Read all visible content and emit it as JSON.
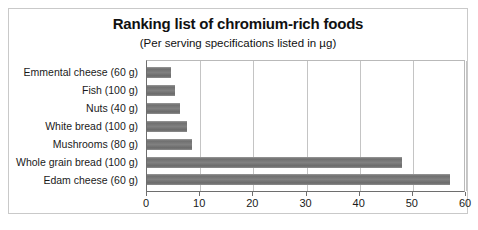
{
  "chart_data": {
    "type": "bar",
    "orientation": "horizontal",
    "title": "Ranking list of chromium-rich foods",
    "subtitle": "(Per serving specifications listed in µg)",
    "xlabel": "",
    "ylabel": "",
    "xlim": [
      0,
      60
    ],
    "xticks": [
      0,
      10,
      20,
      30,
      40,
      50,
      60
    ],
    "grid": true,
    "grid_axis": "x",
    "legend": false,
    "categories": [
      "Emmental cheese (60 g)",
      "Fish (100 g)",
      "Nuts (40 g)",
      "White bread (100 g)",
      "Mushrooms (80 g)",
      "Whole grain bread (100 g)",
      "Edam cheese (60 g)"
    ],
    "values": [
      4.5,
      5.3,
      6.2,
      7.6,
      8.4,
      48,
      57
    ],
    "bar_color": "#7a7a7a",
    "background_color": "#ffffff",
    "axis_color": "#6e6e6e",
    "grid_color": "#c4c4c4"
  }
}
